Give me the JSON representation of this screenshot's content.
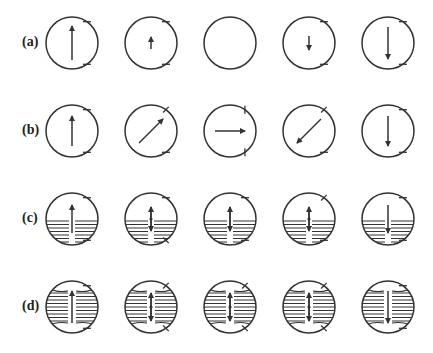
{
  "figure": {
    "stroke_color": "#333333",
    "circle_radius": 26,
    "column_x": [
      72,
      151,
      230,
      309,
      388
    ],
    "rows": [
      {
        "label": "(a)",
        "y": 43,
        "hatched": false,
        "cells": [
          {
            "arrow": {
              "x1": 0,
              "y1": 17,
              "x2": 0,
              "y2": -17
            },
            "ticks": [
              "tr-h",
              "br-h"
            ]
          },
          {
            "arrow": {
              "x1": 0,
              "y1": 6,
              "x2": 0,
              "y2": -6
            },
            "ticks": [
              "tr-h",
              "br-h"
            ]
          },
          {
            "arrow": null,
            "ticks": []
          },
          {
            "arrow": {
              "x1": 0,
              "y1": -7,
              "x2": 0,
              "y2": 7
            },
            "ticks": [
              "tr-h",
              "br-h"
            ]
          },
          {
            "arrow": {
              "x1": 0,
              "y1": -16,
              "x2": 0,
              "y2": 16
            },
            "ticks": [
              "tr-h",
              "br-h"
            ]
          }
        ]
      },
      {
        "label": "(b)",
        "y": 131,
        "hatched": false,
        "cells": [
          {
            "arrow": {
              "x1": 0,
              "y1": 15,
              "x2": 0,
              "y2": -15
            },
            "ticks": [
              "tr-h",
              "br-h"
            ]
          },
          {
            "arrow": {
              "x1": -12,
              "y1": 12,
              "x2": 12,
              "y2": -12
            },
            "ticks": [
              "tr-d",
              "br-h"
            ]
          },
          {
            "arrow": {
              "x1": -15,
              "y1": 0,
              "x2": 15,
              "y2": 0
            },
            "ticks": [
              "tr-v",
              "br-v"
            ]
          },
          {
            "arrow": {
              "x1": 12,
              "y1": -12,
              "x2": -12,
              "y2": 12
            },
            "ticks": [
              "tr-d",
              "br-h"
            ]
          },
          {
            "arrow": {
              "x1": 0,
              "y1": -15,
              "x2": 0,
              "y2": 15
            },
            "ticks": [
              "tr-h",
              "br-h"
            ]
          }
        ]
      },
      {
        "label": "(c)",
        "y": 219,
        "hatched": true,
        "hatch_style": "flat",
        "cells": [
          {
            "arrow": {
              "x1": 0,
              "y1": 14,
              "x2": 0,
              "y2": -14
            },
            "double": false,
            "ticks": [
              "tr-h",
              "br-h"
            ]
          },
          {
            "arrow": {
              "x1": 0,
              "y1": 12,
              "x2": 0,
              "y2": -12
            },
            "double": true,
            "ticks": [
              "tr-h",
              "br-d"
            ]
          },
          {
            "arrow": {
              "x1": 0,
              "y1": 12,
              "x2": 0,
              "y2": -12
            },
            "double": true,
            "ticks": [
              "tr-h",
              "br-h"
            ]
          },
          {
            "arrow": {
              "x1": 0,
              "y1": 12,
              "x2": 0,
              "y2": -12
            },
            "double": true,
            "ticks": [
              "tr-d",
              "br-h"
            ]
          },
          {
            "arrow": {
              "x1": 0,
              "y1": -14,
              "x2": 0,
              "y2": 14
            },
            "double": false,
            "ticks": [
              "tr-h",
              "br-h"
            ]
          }
        ]
      },
      {
        "label": "(d)",
        "y": 307,
        "hatched": true,
        "hatch_style": "curved",
        "cells": [
          {
            "arrow": {
              "x1": 0,
              "y1": 16,
              "x2": 0,
              "y2": -16
            },
            "double": false,
            "ticks": [
              "tr-h",
              "br-h"
            ]
          },
          {
            "arrow": {
              "x1": 0,
              "y1": 14,
              "x2": 0,
              "y2": -14
            },
            "double": true,
            "ticks": [
              "tr-d",
              "br-d"
            ]
          },
          {
            "arrow": {
              "x1": 0,
              "y1": 14,
              "x2": 0,
              "y2": -14
            },
            "double": true,
            "ticks": [
              "tr-d",
              "br-d"
            ]
          },
          {
            "arrow": {
              "x1": 0,
              "y1": 14,
              "x2": 0,
              "y2": -14
            },
            "double": true,
            "ticks": [
              "tr-d",
              "br-d"
            ]
          },
          {
            "arrow": {
              "x1": 0,
              "y1": -16,
              "x2": 0,
              "y2": 16
            },
            "double": false,
            "ticks": [
              "tr-h",
              "br-h"
            ]
          }
        ]
      }
    ]
  }
}
